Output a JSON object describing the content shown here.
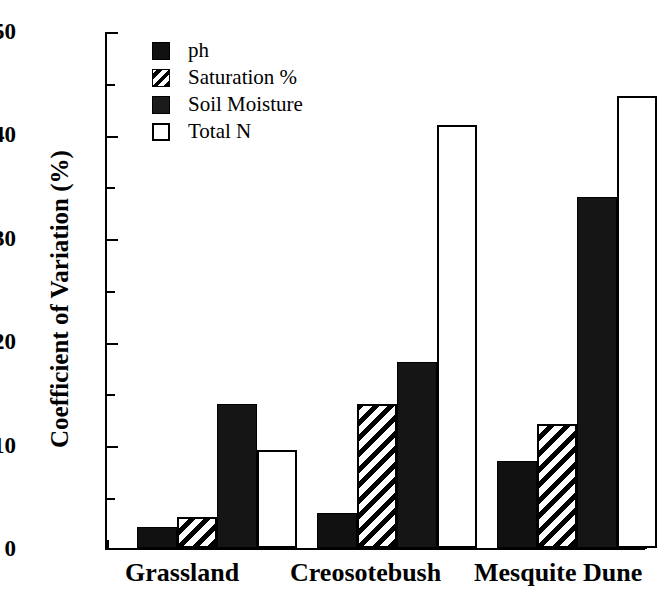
{
  "chart_data": {
    "type": "bar",
    "title": "",
    "xlabel": "",
    "ylabel": "Coefficient of Variation (%)",
    "categories": [
      "Grassland",
      "Creosotebush",
      "Mesquite Dune"
    ],
    "series": [
      {
        "name": "ph",
        "pattern": "solid",
        "values": [
          2.0,
          3.4,
          8.4
        ]
      },
      {
        "name": "Saturation %",
        "pattern": "hatch",
        "values": [
          3.0,
          14.0,
          12.0
        ]
      },
      {
        "name": "Soil Moisture",
        "pattern": "dark",
        "values": [
          14.0,
          18.0,
          34.0
        ]
      },
      {
        "name": "Total N",
        "pattern": "open",
        "values": [
          9.5,
          41.0,
          43.8
        ]
      }
    ],
    "ylim": [
      0,
      50
    ],
    "ytick_major": [
      0,
      10,
      20,
      30,
      40,
      50
    ],
    "ytick_minor": [
      5,
      15,
      25,
      35,
      45
    ],
    "ytick_labels": [
      "0",
      "10",
      "20",
      "30",
      "40",
      "50"
    ],
    "grid": false,
    "legend_position": "top-left",
    "legend_entries": [
      "ph",
      "Saturation %",
      "Soil Moisture",
      "Total N"
    ]
  },
  "axis": {
    "y_title": "Coefficient of Variation (%)",
    "tick_50": "50",
    "tick_40": "40",
    "tick_30": "30",
    "tick_20": "20",
    "tick_10": "10",
    "tick_0": "0"
  },
  "xcats": {
    "c0": "Grassland",
    "c1": "Creosotebush",
    "c2": "Mesquite Dune"
  },
  "legend": {
    "e0": "ph",
    "e1": "Saturation %",
    "e2": "Soil Moisture",
    "e3": "Total N"
  },
  "colors": {
    "ink": "#000000",
    "background": "#ffffff",
    "solid_fill": "#111111",
    "dark_fill": "#151515",
    "open_fill": "#ffffff"
  }
}
